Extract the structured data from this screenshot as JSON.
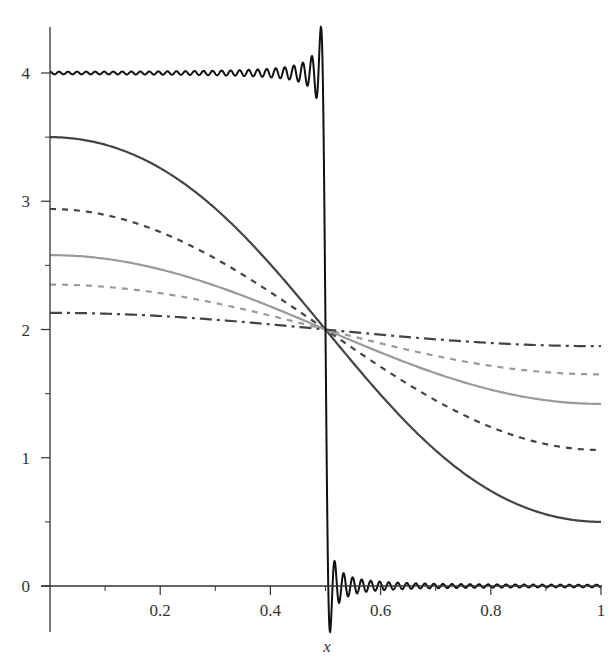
{
  "chart_data": {
    "type": "line",
    "title": "",
    "xlabel": "x",
    "ylabel": "",
    "xlim": [
      0,
      1
    ],
    "ylim": [
      -0.35,
      4.4
    ],
    "grid": false,
    "legend": null,
    "x_ticks": [
      "0.2",
      "0.4",
      "0.6",
      "0.8",
      "1"
    ],
    "x_tick_values": [
      0.2,
      0.4,
      0.6,
      0.8,
      1.0
    ],
    "x_minor_ticks": [
      0.1,
      0.3,
      0.5,
      0.7,
      0.9
    ],
    "y_ticks": [
      "0",
      "1",
      "2",
      "3",
      "4"
    ],
    "y_tick_values": [
      0,
      1,
      2,
      3,
      4
    ],
    "y_minor_ticks": [
      0.5,
      1.5,
      2.5,
      3.5
    ],
    "series": [
      {
        "name": "initial step (Fourier partial sum, t=0)",
        "style": "solid",
        "color": "#111111",
        "description": "Step function: 4 for x<0.5, 0 for x>0.5, with Gibbs oscillations; overshoot max ~4.36, undershoot min ~-0.35",
        "x": [
          0,
          0.45,
          0.5,
          0.55,
          1
        ],
        "values": [
          4,
          4,
          2,
          0,
          0
        ]
      },
      {
        "name": "t1",
        "style": "solid",
        "color": "#444444",
        "x": [
          0,
          0.25,
          0.5,
          0.75,
          1
        ],
        "values": [
          3.54,
          3.09,
          2.0,
          0.91,
          0.46
        ]
      },
      {
        "name": "t2",
        "style": "dashed",
        "color": "#444444",
        "x": [
          0,
          0.25,
          0.5,
          0.75,
          1
        ],
        "values": [
          2.94,
          2.66,
          2.0,
          1.34,
          1.06
        ]
      },
      {
        "name": "t3",
        "style": "solid",
        "color": "#9a9a9a",
        "x": [
          0,
          0.25,
          0.5,
          0.75,
          1
        ],
        "values": [
          2.58,
          2.41,
          2.0,
          1.59,
          1.42
        ]
      },
      {
        "name": "t4",
        "style": "dashed",
        "color": "#9a9a9a",
        "x": [
          0,
          0.25,
          0.5,
          0.75,
          1
        ],
        "values": [
          2.35,
          2.25,
          2.0,
          1.75,
          1.65
        ]
      },
      {
        "name": "t5",
        "style": "dashdot",
        "color": "#444444",
        "x": [
          0,
          0.25,
          0.5,
          0.75,
          1
        ],
        "values": [
          2.13,
          2.09,
          2.0,
          1.91,
          1.87
        ]
      }
    ],
    "curve_amplitudes": [
      1.54,
      0.94,
      0.58,
      0.35,
      0.13
    ],
    "center_point": [
      0.5,
      2
    ]
  }
}
